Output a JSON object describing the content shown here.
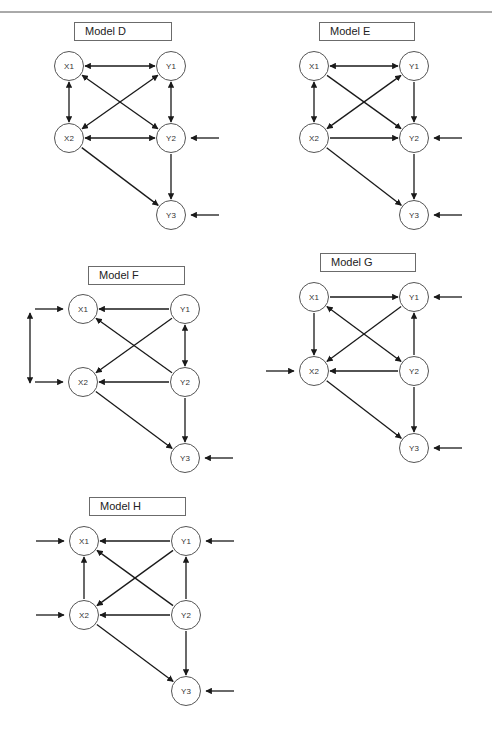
{
  "page": {
    "width": 492,
    "height": 730,
    "top_rule_y": 12
  },
  "colors": {
    "line": "#1a1a1a",
    "node_border": "#555555",
    "box_border": "#6b6b6b",
    "text": "#222222"
  },
  "models": [
    {
      "id": "D",
      "title": "Model D",
      "box": {
        "x": 74,
        "y": 22,
        "w": 98
      },
      "nodes": {
        "X1": [
          69,
          66
        ],
        "Y1": [
          171,
          66
        ],
        "X2": [
          69,
          138
        ],
        "Y2": [
          171,
          138
        ],
        "Y3": [
          171,
          215
        ]
      },
      "edges": [
        {
          "from": "X1",
          "to": "Y1",
          "type": "double"
        },
        {
          "from": "X1",
          "to": "X2",
          "type": "double"
        },
        {
          "from": "Y1",
          "to": "Y2",
          "type": "double"
        },
        {
          "from": "X1",
          "to": "Y2",
          "type": "double"
        },
        {
          "from": "X2",
          "to": "Y1",
          "type": "double"
        },
        {
          "from": "X2",
          "to": "Y2",
          "type": "double"
        },
        {
          "from": "Y2",
          "to": "Y3",
          "type": "single"
        },
        {
          "from": "X2",
          "to": "Y3",
          "type": "single"
        }
      ],
      "errors": [
        {
          "node": "Y2",
          "side": "right"
        },
        {
          "node": "Y3",
          "side": "right"
        }
      ]
    },
    {
      "id": "E",
      "title": "Model E",
      "box": {
        "x": 319,
        "y": 22,
        "w": 96
      },
      "nodes": {
        "X1": [
          314,
          66
        ],
        "Y1": [
          414,
          66
        ],
        "X2": [
          314,
          138
        ],
        "Y2": [
          414,
          138
        ],
        "Y3": [
          414,
          215
        ]
      },
      "edges": [
        {
          "from": "X1",
          "to": "Y1",
          "type": "double"
        },
        {
          "from": "X1",
          "to": "X2",
          "type": "double"
        },
        {
          "from": "X2",
          "to": "Y1",
          "type": "double"
        },
        {
          "from": "X1",
          "to": "Y2",
          "type": "single"
        },
        {
          "from": "Y1",
          "to": "Y2",
          "type": "single"
        },
        {
          "from": "X2",
          "to": "Y2",
          "type": "single"
        },
        {
          "from": "Y2",
          "to": "Y3",
          "type": "single"
        },
        {
          "from": "X2",
          "to": "Y3",
          "type": "single"
        }
      ],
      "errors": [
        {
          "node": "Y2",
          "side": "right"
        },
        {
          "node": "Y3",
          "side": "right"
        }
      ]
    },
    {
      "id": "F",
      "title": "Model F",
      "box": {
        "x": 88,
        "y": 266,
        "w": 97
      },
      "nodes": {
        "X1": [
          83,
          309
        ],
        "Y1": [
          185,
          309
        ],
        "X2": [
          83,
          382
        ],
        "Y2": [
          185,
          382
        ],
        "Y3": [
          185,
          458
        ]
      },
      "edges": [
        {
          "from": "Y1",
          "to": "X1",
          "type": "single"
        },
        {
          "from": "Y1",
          "to": "X2",
          "type": "single"
        },
        {
          "from": "Y1",
          "to": "Y2",
          "type": "double"
        },
        {
          "from": "Y2",
          "to": "X1",
          "type": "single"
        },
        {
          "from": "Y2",
          "to": "X2",
          "type": "single"
        },
        {
          "from": "Y2",
          "to": "Y3",
          "type": "single"
        },
        {
          "from": "X2",
          "to": "Y3",
          "type": "single"
        }
      ],
      "errors": [
        {
          "node": "X1",
          "side": "left"
        },
        {
          "node": "X2",
          "side": "left"
        },
        {
          "node": "Y3",
          "side": "right"
        }
      ],
      "correlated_errors": {
        "x": 30,
        "y1": 313,
        "y2": 383
      }
    },
    {
      "id": "G",
      "title": "Model G",
      "box": {
        "x": 320,
        "y": 253,
        "w": 96
      },
      "nodes": {
        "X1": [
          314,
          297
        ],
        "Y1": [
          414,
          297
        ],
        "X2": [
          314,
          371
        ],
        "Y2": [
          414,
          371
        ],
        "Y3": [
          414,
          448
        ]
      },
      "edges": [
        {
          "from": "X1",
          "to": "Y1",
          "type": "single"
        },
        {
          "from": "X1",
          "to": "X2",
          "type": "single"
        },
        {
          "from": "Y1",
          "to": "X2",
          "type": "single"
        },
        {
          "from": "X1",
          "to": "Y2",
          "type": "double"
        },
        {
          "from": "Y2",
          "to": "Y1",
          "type": "single"
        },
        {
          "from": "Y2",
          "to": "X2",
          "type": "single"
        },
        {
          "from": "Y2",
          "to": "Y3",
          "type": "single"
        },
        {
          "from": "X2",
          "to": "Y3",
          "type": "single"
        }
      ],
      "errors": [
        {
          "node": "Y1",
          "side": "right"
        },
        {
          "node": "X2",
          "side": "left"
        },
        {
          "node": "Y3",
          "side": "right"
        }
      ]
    },
    {
      "id": "H",
      "title": "Model H",
      "box": {
        "x": 89,
        "y": 497,
        "w": 97
      },
      "nodes": {
        "X1": [
          84,
          541
        ],
        "Y1": [
          186,
          541
        ],
        "X2": [
          84,
          615
        ],
        "Y2": [
          186,
          615
        ],
        "Y3": [
          186,
          691
        ]
      },
      "edges": [
        {
          "from": "Y1",
          "to": "X1",
          "type": "single"
        },
        {
          "from": "X2",
          "to": "X1",
          "type": "single"
        },
        {
          "from": "Y1",
          "to": "X2",
          "type": "single"
        },
        {
          "from": "Y2",
          "to": "X1",
          "type": "single"
        },
        {
          "from": "Y2",
          "to": "Y1",
          "type": "single"
        },
        {
          "from": "Y2",
          "to": "X2",
          "type": "single"
        },
        {
          "from": "Y2",
          "to": "Y3",
          "type": "single"
        },
        {
          "from": "X2",
          "to": "Y3",
          "type": "single"
        }
      ],
      "errors": [
        {
          "node": "X1",
          "side": "left"
        },
        {
          "node": "Y1",
          "side": "right"
        },
        {
          "node": "X2",
          "side": "left"
        },
        {
          "node": "Y3",
          "side": "right"
        }
      ]
    }
  ]
}
